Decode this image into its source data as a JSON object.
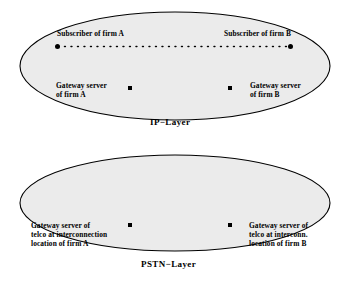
{
  "diagram": {
    "background_color": "#ffffff",
    "ellipse_fill": "#ebebeb",
    "ellipse_stroke": "#000000",
    "layers": [
      {
        "id": "ip-layer",
        "title": "IP−Layer",
        "nodes": [
          {
            "id": "subscriber-a",
            "label": "Subscriber of firm A",
            "marker": "dot"
          },
          {
            "id": "subscriber-b",
            "label": "Subscriber of firm B",
            "marker": "dot"
          },
          {
            "id": "gateway-a",
            "label_line1": "Gateway server",
            "label_line2": "of firm A",
            "marker": "square"
          },
          {
            "id": "gateway-b",
            "label_line1": "Gateway server",
            "label_line2": "of firm B",
            "marker": "square"
          }
        ],
        "connection": {
          "id": "subscriber-link",
          "style": "dotted"
        }
      },
      {
        "id": "pstn-layer",
        "title": "PSTN−Layer",
        "nodes": [
          {
            "id": "telco-gateway-a",
            "label_line1": "Gateway server of",
            "label_line2": "telco at interconnection",
            "label_line3": "location of firm A",
            "marker": "square"
          },
          {
            "id": "telco-gateway-b",
            "label_line1": "Gateway server of",
            "label_line2": "telco at interconn.",
            "label_line3": "location of firm B",
            "marker": "square"
          }
        ]
      }
    ]
  }
}
